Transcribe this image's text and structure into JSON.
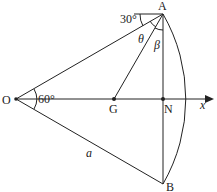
{
  "diagram": {
    "points": {
      "O": {
        "label": "O",
        "x": 16,
        "y": 99
      },
      "A": {
        "label": "A",
        "x": 163,
        "y": 14
      },
      "B": {
        "label": "B",
        "x": 163,
        "y": 184
      },
      "G": {
        "label": "G",
        "x": 114,
        "y": 99
      },
      "N": {
        "label": "N",
        "x": 163,
        "y": 99
      }
    },
    "axis_label": "x",
    "angles": {
      "at_O": "60°",
      "at_A_horizontal": "30°",
      "theta": "θ",
      "beta": "β"
    },
    "side_label": "a"
  }
}
